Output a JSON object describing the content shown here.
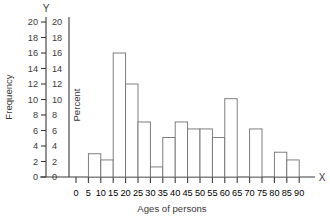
{
  "chart_data": {
    "type": "bar",
    "title": "",
    "subtitle": "",
    "xlabel": "Ages of persons",
    "ylabel": "Frequency",
    "y2label": "Percent",
    "x_axis_marker": "X",
    "y_axis_marker": "Y",
    "xlim": [
      0,
      95
    ],
    "ylim": [
      0,
      20
    ],
    "y2lim": [
      0,
      20
    ],
    "grid": false,
    "legend": "none",
    "xticks": [
      0,
      5,
      10,
      15,
      20,
      25,
      30,
      35,
      40,
      45,
      50,
      55,
      60,
      65,
      70,
      75,
      80,
      85,
      90
    ],
    "xtick_labels": [
      "0",
      "5",
      "10",
      "15",
      "20",
      "25",
      "30",
      "35",
      "40",
      "45",
      "50",
      "55",
      "60",
      "65",
      "70",
      "75",
      "80",
      "85",
      "90"
    ],
    "yticks": [
      0,
      2,
      4,
      6,
      8,
      10,
      12,
      14,
      16,
      18,
      20
    ],
    "ytick_labels": [
      "0",
      "2",
      "4",
      "6",
      "8",
      "10",
      "12",
      "14",
      "16",
      "18",
      "20"
    ],
    "y2ticks": [
      0,
      2,
      4,
      6,
      8,
      10,
      12,
      14,
      16,
      18,
      20
    ],
    "y2tick_labels": [
      "0",
      "2",
      "4",
      "6",
      "8",
      "10",
      "12",
      "14",
      "16",
      "18",
      "20"
    ],
    "bin_width": 5,
    "bins": [
      {
        "start": 0,
        "end": 5,
        "label": "0-5",
        "value": 0
      },
      {
        "start": 5,
        "end": 10,
        "label": "5-10",
        "value": 3.0
      },
      {
        "start": 10,
        "end": 15,
        "label": "10-15",
        "value": 2.2
      },
      {
        "start": 15,
        "end": 20,
        "label": "15-20",
        "value": 16.0
      },
      {
        "start": 20,
        "end": 25,
        "label": "20-25",
        "value": 12.0
      },
      {
        "start": 25,
        "end": 30,
        "label": "25-30",
        "value": 7.1
      },
      {
        "start": 30,
        "end": 35,
        "label": "30-35",
        "value": 1.3
      },
      {
        "start": 35,
        "end": 40,
        "label": "35-40",
        "value": 5.1
      },
      {
        "start": 40,
        "end": 45,
        "label": "40-45",
        "value": 7.1
      },
      {
        "start": 45,
        "end": 50,
        "label": "45-50",
        "value": 6.2
      },
      {
        "start": 50,
        "end": 55,
        "label": "50-55",
        "value": 6.2
      },
      {
        "start": 55,
        "end": 60,
        "label": "55-60",
        "value": 5.1
      },
      {
        "start": 60,
        "end": 65,
        "label": "60-65",
        "value": 10.1
      },
      {
        "start": 65,
        "end": 70,
        "label": "65-70",
        "value": 0
      },
      {
        "start": 70,
        "end": 75,
        "label": "70-75",
        "value": 6.2
      },
      {
        "start": 75,
        "end": 80,
        "label": "75-80",
        "value": 0
      },
      {
        "start": 80,
        "end": 85,
        "label": "80-85",
        "value": 3.2
      },
      {
        "start": 85,
        "end": 90,
        "label": "85-90",
        "value": 2.2
      }
    ],
    "categories": [
      "0-5",
      "5-10",
      "10-15",
      "15-20",
      "20-25",
      "25-30",
      "30-35",
      "35-40",
      "40-45",
      "45-50",
      "50-55",
      "55-60",
      "60-65",
      "65-70",
      "70-75",
      "75-80",
      "80-85",
      "85-90"
    ],
    "values": [
      0,
      3.0,
      2.2,
      16.0,
      12.0,
      7.1,
      1.3,
      5.1,
      7.1,
      6.2,
      6.2,
      5.1,
      10.1,
      0,
      6.2,
      0,
      3.2,
      2.2
    ],
    "colors": {
      "bar_fill": "#ffffff",
      "bar_stroke": "#707070",
      "axis": "#3a3a3a",
      "text": "#3a3a3a",
      "background": "#ffffff"
    }
  }
}
